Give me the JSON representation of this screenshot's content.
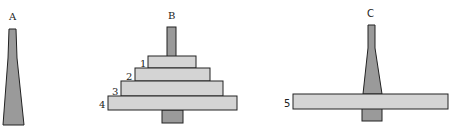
{
  "colors": {
    "peg": "#9a9a9a",
    "disk": "#d4d4d4",
    "stroke": "#222222",
    "background": "#ffffff"
  },
  "pegs": [
    {
      "label": "A",
      "disks": []
    },
    {
      "label": "B",
      "disks": [
        "1",
        "2",
        "3",
        "4"
      ]
    },
    {
      "label": "C",
      "disks": [
        "5"
      ]
    }
  ],
  "disk_labels": {
    "d1": "1",
    "d2": "2",
    "d3": "3",
    "d4": "4",
    "d5": "5"
  }
}
